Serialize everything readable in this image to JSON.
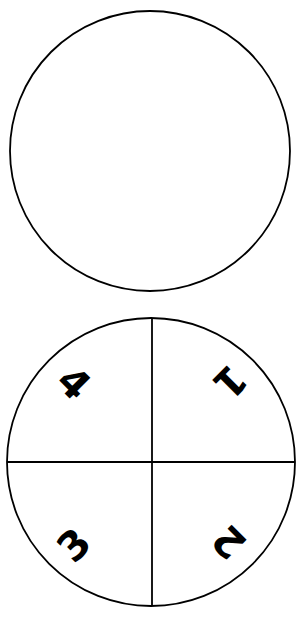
{
  "diagram": {
    "stroke_color": "#000000",
    "background": "#ffffff",
    "top_circle": {
      "cx": 150,
      "cy": 151,
      "r": 140,
      "divided": false
    },
    "bottom_circle": {
      "cx": 151,
      "cy": 462,
      "r": 144,
      "divided": true,
      "quadrants": [
        {
          "position": "top-right",
          "label": "1",
          "x": 230,
          "y": 382,
          "rotation": 135
        },
        {
          "position": "bottom-right",
          "label": "2",
          "x": 229,
          "y": 542,
          "rotation": 225
        },
        {
          "position": "bottom-left",
          "label": "3",
          "x": 74,
          "y": 545,
          "rotation": -45
        },
        {
          "position": "top-left",
          "label": "4",
          "x": 74,
          "y": 383,
          "rotation": 45
        }
      ]
    }
  }
}
